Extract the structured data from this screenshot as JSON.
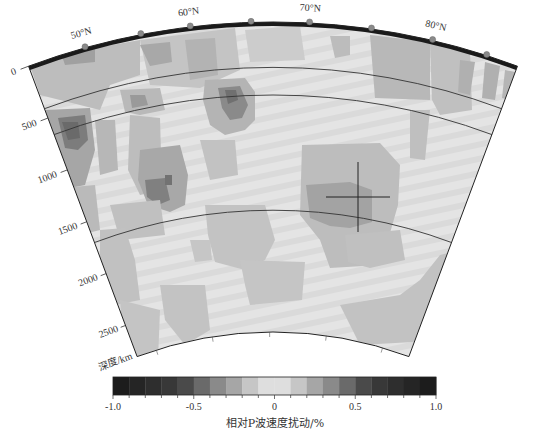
{
  "figure": {
    "title_axis": "深度/km",
    "latitude_labels": [
      {
        "text": "50°N",
        "angle_deg": -15.6
      },
      {
        "text": "60°N",
        "angle_deg": -6.8
      },
      {
        "text": "70°N",
        "angle_deg": 3.0
      },
      {
        "text": "80°N",
        "angle_deg": 13.2
      }
    ],
    "station_markers_deg": [
      -15.6,
      -10.9,
      -6.8,
      -1.8,
      3.0,
      8.1,
      13.2,
      17.8
    ],
    "depth_ticks": [
      {
        "text": "0",
        "depth": 0
      },
      {
        "text": "500",
        "depth": 500
      },
      {
        "text": "1000",
        "depth": 1000
      },
      {
        "text": "1500",
        "depth": 1500
      },
      {
        "text": "2000",
        "depth": 2000
      },
      {
        "text": "2500",
        "depth": 2500
      }
    ],
    "discontinuities_km": [
      410,
      660,
      1700
    ],
    "max_depth_km": 2800,
    "cross_marker": {
      "x": 358,
      "y": 197,
      "half_w": 32,
      "half_h": 35
    }
  },
  "colorbar": {
    "title": "相对P波速度扰动/%",
    "min": -1.0,
    "max": 1.0,
    "step": 0.1,
    "tick_labels": [
      "-1.0",
      "-0.5",
      "0",
      "0.5",
      "1.0"
    ],
    "segment_colors": [
      "#1c1c1c",
      "#252525",
      "#2e2e2e",
      "#383838",
      "#4a4a4a",
      "#6a6a6a",
      "#8a8a8a",
      "#a6a6a6",
      "#c6c6c6",
      "#dedede",
      "#dedede",
      "#c6c6c6",
      "#a6a6a6",
      "#8a8a8a",
      "#6a6a6a",
      "#4a4a4a",
      "#383838",
      "#2e2e2e",
      "#252525",
      "#1c1c1c"
    ]
  },
  "chart_data": {
    "type": "heatmap",
    "title": "",
    "xlabel": "latitude (°N)",
    "ylabel": "深度/km",
    "x_tick_labels": [
      "50°N",
      "60°N",
      "70°N",
      "80°N"
    ],
    "y_tick_labels": [
      "0",
      "500",
      "1000",
      "1500",
      "2000",
      "2500"
    ],
    "ylim": [
      0,
      2800
    ],
    "colorbar": {
      "label": "相对P波速度扰动/%",
      "range": [
        -1.0,
        1.0
      ],
      "ticks": [
        -1.0,
        -0.5,
        0,
        0.5,
        1.0
      ]
    },
    "reference_depths_km": [
      410,
      660,
      1700
    ],
    "notable_anomalies": [
      {
        "lat_approx": 50,
        "depth_km_approx": 650,
        "amplitude_pct_approx": -0.6
      },
      {
        "lat_approx": 57,
        "depth_km_approx": 1200,
        "amplitude_pct_approx": -0.6
      },
      {
        "lat_approx": 63,
        "depth_km_approx": 550,
        "amplitude_pct_approx": -0.6
      },
      {
        "lat_approx": 75,
        "depth_km_approx": 1450,
        "amplitude_pct_approx": -0.4
      },
      {
        "lat_approx": 80,
        "depth_km_approx": 300,
        "amplitude_pct_approx": -0.3
      }
    ]
  }
}
